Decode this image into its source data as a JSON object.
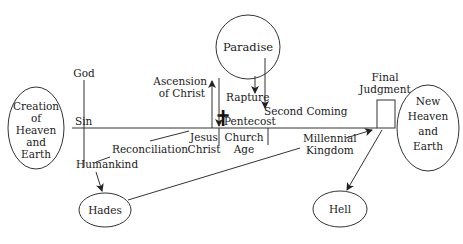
{
  "diagram": {
    "nodes": {
      "creation": {
        "lines": [
          "Creation",
          "of",
          "Heaven",
          "and",
          "Earth"
        ]
      },
      "paradise": {
        "label": "Paradise"
      },
      "new_heaven": {
        "lines": [
          "New",
          "Heaven",
          "and",
          "Earth"
        ]
      },
      "hades": {
        "label": "Hades"
      },
      "hell": {
        "label": "Hell"
      },
      "final_judgment": {
        "lines": [
          "Final",
          "Judgment"
        ]
      }
    },
    "labels": {
      "god": "God",
      "sin": "Sin",
      "humankind": "Humankind",
      "reconciliation": "Reconciliation",
      "ascension": [
        "Ascension",
        "of Christ"
      ],
      "rapture": "Rapture",
      "second_coming": "Second Coming",
      "pentecost": "Pentecost",
      "jesus_christ": [
        "Jesus",
        "Christ"
      ],
      "church_age": [
        "Church",
        "Age"
      ],
      "millennial_kingdom": [
        "Millennial",
        "Kingdom"
      ]
    },
    "icons": {
      "cross": "✝"
    }
  }
}
